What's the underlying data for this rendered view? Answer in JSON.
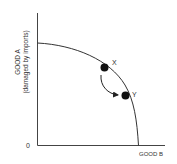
{
  "diagram": {
    "type": "production-possibilities-frontier",
    "y_axis": {
      "label_line1": "GOOD A",
      "label_line2": "(damaged by imports)"
    },
    "x_axis": {
      "label": "GOOD B"
    },
    "origin_label": "0",
    "points": [
      {
        "id": "X",
        "label": "X"
      },
      {
        "id": "Y",
        "label": "Y"
      }
    ],
    "arrow": {
      "from": "X",
      "to": "Y"
    },
    "colors": {
      "line": "#333333",
      "point": "#111111",
      "text": "#333333"
    }
  }
}
